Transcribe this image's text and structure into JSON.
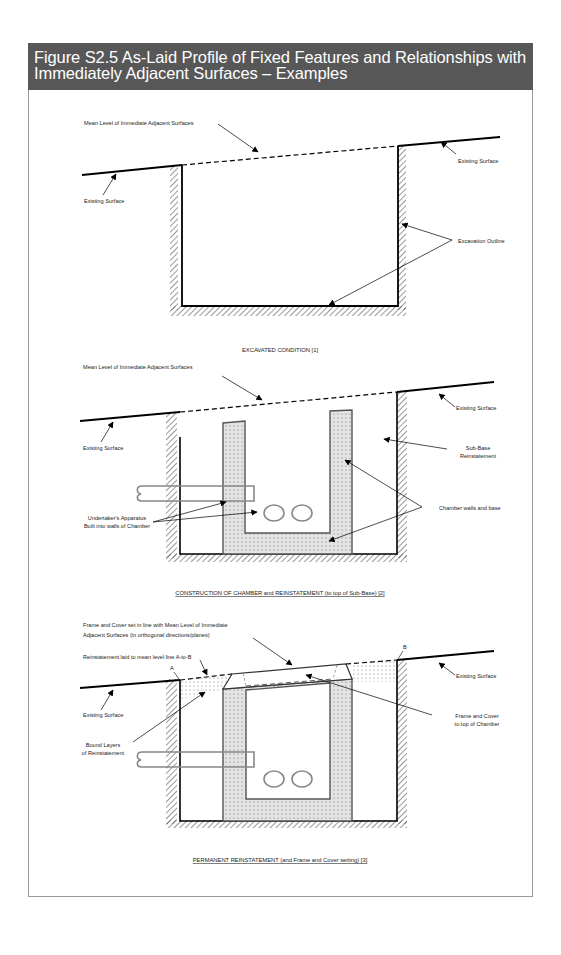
{
  "figure": {
    "title_line1": "Figure S2.5 As-Laid Profile of Fixed Features and Relationships with",
    "title_line2": "Immediately Adjacent Surfaces – Examples",
    "header_color": "#575757"
  },
  "diagrams": [
    {
      "id": "excavated",
      "labels": {
        "mean_level": "Mean Level of Immediate Adjacent Surfaces",
        "existing_surface_left": "Existing Surface",
        "existing_surface_right": "Existing Surface",
        "excavation_outline": "Excavation Outline"
      },
      "caption": "EXCAVATED CONDITION [1]"
    },
    {
      "id": "construction",
      "labels": {
        "mean_level": "Mean Level of Immediate Adjacent Surfaces",
        "existing_surface_left": "Existing Surface",
        "existing_surface_right": "Existing Surface",
        "sub_base_1": "Sub-Base",
        "sub_base_2": "Reinstatement",
        "apparatus_1": "Undertaker's Apparatus",
        "apparatus_2": "Built into walls of Chamber",
        "chamber": "Chamber walls and base"
      },
      "caption": "CONSTRUCTION OF CHAMBER and REINSTATEMENT (to top of Sub-Base) [2]"
    },
    {
      "id": "permanent",
      "labels": {
        "frame_cover_1": "Frame and Cover set in line with Mean Level of Immediate",
        "frame_cover_2": "Adjacent Surfaces (in orthogonal directions/planes)",
        "reinstatement_line": "Reinstatement laid to mean level line A-to-B",
        "point_a": "A",
        "point_b": "B",
        "existing_surface_left": "Existing Surface",
        "existing_surface_right": "Existing Surface",
        "bound_layers_1": "Bound Layers",
        "bound_layers_2": "of Reinstatement",
        "frame_top_1": "Frame and Cover",
        "frame_top_2": "to top of Chamber"
      },
      "caption": "PERMANENT REINSTATEMENT (and Frame and Cover setting) [3]"
    }
  ]
}
